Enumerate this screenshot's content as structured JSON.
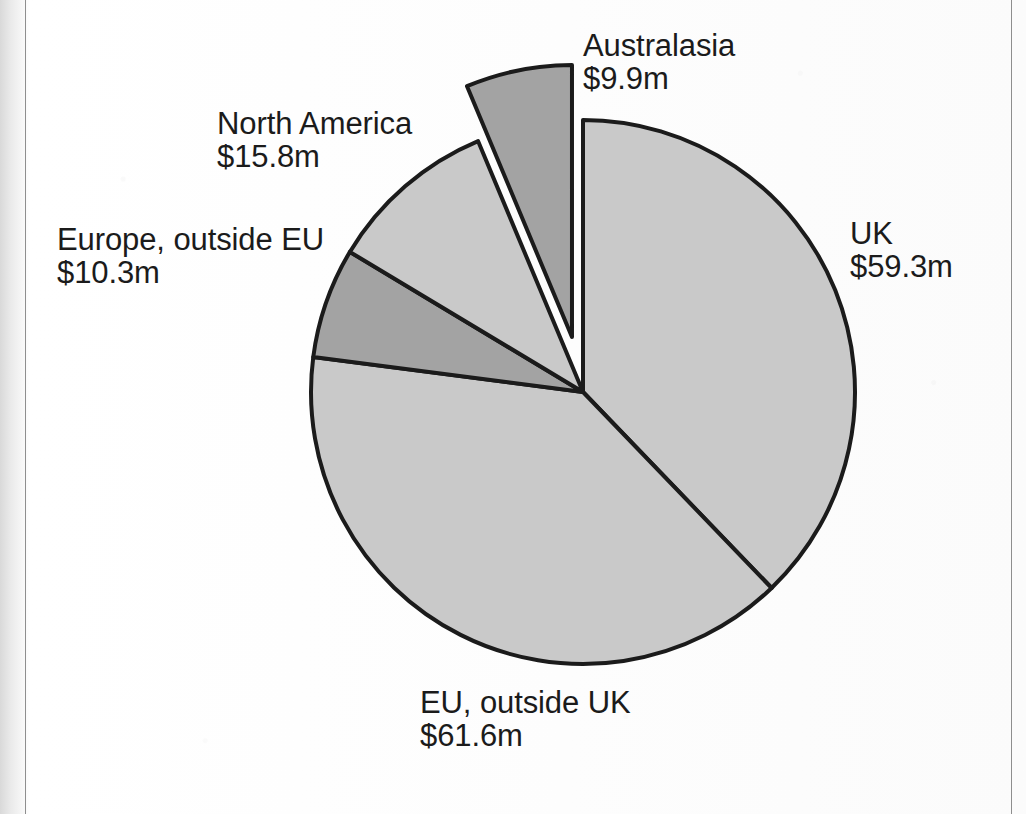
{
  "chart_data": {
    "type": "pie",
    "title": "",
    "subtitle": "",
    "xlabel": "",
    "ylabel": "",
    "units": "$m",
    "legend_position": "none",
    "grid": false,
    "start_angle_deg": 0,
    "direction": "clockwise",
    "total": 156.9,
    "categories": [
      "UK",
      "EU, outside UK",
      "Europe, outside EU",
      "North America",
      "Australasia"
    ],
    "values": [
      59.3,
      61.6,
      10.3,
      15.8,
      9.9
    ],
    "value_labels": [
      "$59.3m",
      "$61.6m",
      "$10.3m",
      "$15.8m",
      "$9.9m"
    ],
    "slices": [
      {
        "name": "UK",
        "value": 59.3,
        "value_label": "$59.3m",
        "percent": 37.8,
        "angle_deg": 136.1,
        "start_deg": 0,
        "end_deg": 136.1,
        "color": "#c9c9c9",
        "exploded": false,
        "label_position": "right"
      },
      {
        "name": "EU, outside UK",
        "value": 61.6,
        "value_label": "$61.6m",
        "percent": 39.3,
        "angle_deg": 141.3,
        "start_deg": 136.1,
        "end_deg": 277.4,
        "color": "#c9c9c9",
        "exploded": false,
        "label_position": "bottom"
      },
      {
        "name": "Europe, outside EU",
        "value": 10.3,
        "value_label": "$10.3m",
        "percent": 6.6,
        "angle_deg": 23.6,
        "start_deg": 277.4,
        "end_deg": 301.0,
        "color": "#a3a3a3",
        "exploded": false,
        "label_position": "left"
      },
      {
        "name": "North America",
        "value": 15.8,
        "value_label": "$15.8m",
        "percent": 10.1,
        "angle_deg": 36.3,
        "start_deg": 301.0,
        "end_deg": 337.3,
        "color": "#c9c9c9",
        "exploded": false,
        "label_position": "top-left"
      },
      {
        "name": "Australasia",
        "value": 9.9,
        "value_label": "$9.9m",
        "percent": 6.3,
        "angle_deg": 22.7,
        "start_deg": 337.3,
        "end_deg": 360.0,
        "color": "#a3a3a3",
        "exploded": true,
        "label_position": "top-right"
      }
    ],
    "geometry": {
      "center_x": 583,
      "center_y": 392,
      "radius": 272,
      "explode_offset": 56
    },
    "style": {
      "stroke": "#1b1b1b",
      "stroke_width": 4,
      "light_fill": "#c9c9c9",
      "dark_fill": "#a3a3a3",
      "background": "#ffffff",
      "label_color": "#1b1b1b"
    }
  },
  "labels": {
    "uk": {
      "name": "UK",
      "value": "$59.3m"
    },
    "eu_outside_uk": {
      "name": "EU, outside UK",
      "value": "$61.6m"
    },
    "europe_outside_eu": {
      "name": "Europe, outside EU",
      "value": "$10.3m"
    },
    "north_america": {
      "name": "North America",
      "value": "$15.8m"
    },
    "australasia": {
      "name": "Australasia",
      "value": "$9.9m"
    }
  }
}
